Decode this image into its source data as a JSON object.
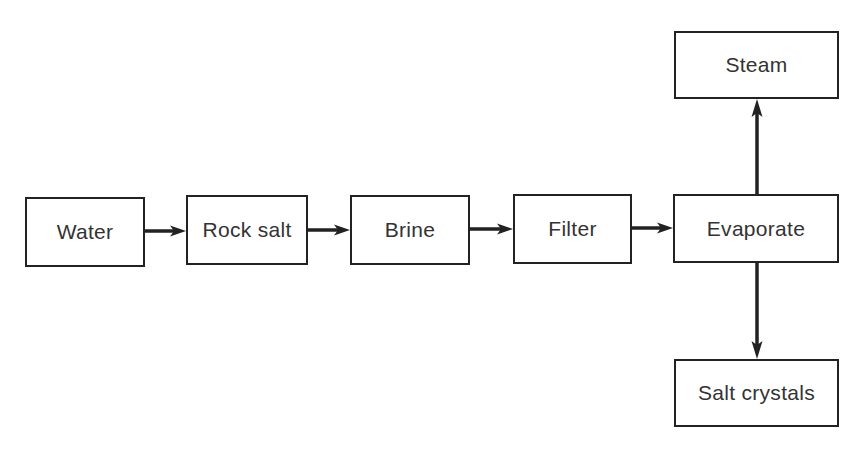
{
  "diagram": {
    "type": "flowchart",
    "nodes": [
      {
        "id": "water",
        "label": "Water",
        "x": 25,
        "y": 197,
        "w": 120,
        "h": 70
      },
      {
        "id": "rock_salt",
        "label": "Rock salt",
        "x": 186,
        "y": 195,
        "w": 122,
        "h": 70
      },
      {
        "id": "brine",
        "label": "Brine",
        "x": 350,
        "y": 195,
        "w": 120,
        "h": 70
      },
      {
        "id": "filter",
        "label": "Filter",
        "x": 513,
        "y": 194,
        "w": 119,
        "h": 70
      },
      {
        "id": "evaporate",
        "label": "Evaporate",
        "x": 673,
        "y": 194,
        "w": 166,
        "h": 69
      },
      {
        "id": "steam",
        "label": "Steam",
        "x": 674,
        "y": 31,
        "w": 165,
        "h": 68
      },
      {
        "id": "salt_crystals",
        "label": "Salt crystals",
        "x": 674,
        "y": 359,
        "w": 165,
        "h": 68
      }
    ],
    "edges": [
      {
        "from": "water",
        "to": "rock_salt"
      },
      {
        "from": "rock_salt",
        "to": "brine"
      },
      {
        "from": "brine",
        "to": "filter"
      },
      {
        "from": "filter",
        "to": "evaporate"
      },
      {
        "from": "evaporate",
        "to": "steam"
      },
      {
        "from": "evaporate",
        "to": "salt_crystals"
      }
    ],
    "colors": {
      "stroke": "#222222",
      "text": "#333333",
      "background": "#ffffff"
    }
  }
}
